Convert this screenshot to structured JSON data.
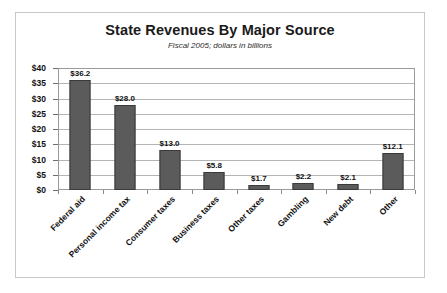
{
  "chart_data": {
    "type": "bar",
    "title": "State Revenues By Major Source",
    "subtitle": "Fiscal 2005; dollars in billions",
    "xlabel": "",
    "ylabel": "",
    "ylim": [
      0,
      40
    ],
    "ytick_step": 5,
    "ytick_labels": [
      "$0",
      "$5",
      "$10",
      "$15",
      "$20",
      "$25",
      "$30",
      "$35",
      "$40"
    ],
    "grid": true,
    "legend": "none",
    "orientation": "vertical",
    "bar_color": "#5b5b5b",
    "categories": [
      "Federal aid",
      "Personal income tax",
      "Consumer taxes",
      "Business taxes",
      "Other taxes",
      "Gambling",
      "New debt",
      "Other"
    ],
    "values": [
      36.2,
      28.0,
      13.0,
      5.8,
      1.7,
      2.2,
      2.1,
      12.1
    ],
    "data_labels": [
      "$36.2",
      "$28.0",
      "$13.0",
      "$5.8",
      "$1.7",
      "$2.2",
      "$2.1",
      "$12.1"
    ]
  }
}
